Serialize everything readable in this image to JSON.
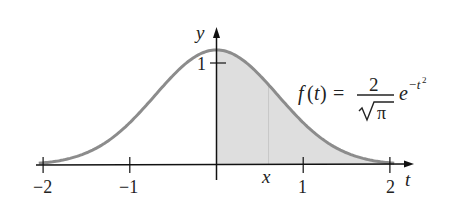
{
  "chart_data": {
    "type": "area",
    "title": "",
    "function_label": {
      "lhs": "f(t) =",
      "numerator": "2",
      "denominator": "π",
      "base": "e",
      "exponent": "−t",
      "exponent_power": "2"
    },
    "xlabel": "t",
    "ylabel": "y",
    "x_ticks": [
      -2,
      -1,
      1,
      2
    ],
    "x_tick_labels": [
      "−2",
      "−1",
      "1",
      "2"
    ],
    "y_ticks": [
      1
    ],
    "y_tick_labels": [
      "1"
    ],
    "xlim": [
      -2,
      2.2
    ],
    "ylim": [
      0,
      1.35
    ],
    "shaded_region": {
      "from": 0,
      "to": 2,
      "label": "shaded area under curve for t ≥ 0"
    },
    "marker": {
      "t": 0.6,
      "label": "x"
    },
    "series": [
      {
        "name": "f(t) = 2/√π · e^(−t²)",
        "x": [
          -2,
          -1.5,
          -1,
          -0.5,
          0,
          0.5,
          1,
          1.5,
          2
        ],
        "values": [
          0.021,
          0.119,
          0.415,
          0.879,
          1.128,
          0.879,
          0.415,
          0.119,
          0.021
        ]
      }
    ],
    "colors": {
      "curve": "#8c8c8c",
      "fill": "#dedede",
      "axes": "#111111"
    },
    "grid": false,
    "legend": "none"
  }
}
